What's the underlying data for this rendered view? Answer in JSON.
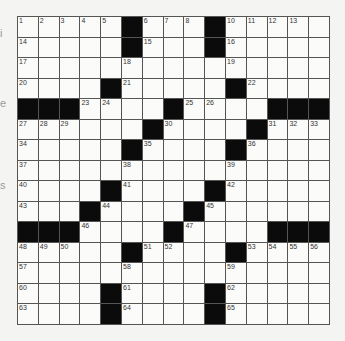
{
  "puzzle": {
    "rows": 15,
    "cols": 15,
    "blocks": [
      [
        5,
        9
      ],
      [
        5,
        9
      ],
      [],
      [
        4,
        10
      ],
      [
        0,
        1,
        2,
        7,
        12,
        13,
        14
      ],
      [
        6,
        11
      ],
      [
        5,
        10
      ],
      [],
      [
        4,
        9
      ],
      [
        3,
        8
      ],
      [
        0,
        1,
        2,
        7,
        12,
        13,
        14
      ],
      [
        5,
        10
      ],
      [],
      [
        4,
        9
      ],
      [
        4,
        9
      ]
    ],
    "numbers": [
      [
        0,
        0,
        "1"
      ],
      [
        0,
        1,
        "2"
      ],
      [
        0,
        2,
        "3"
      ],
      [
        0,
        3,
        "4"
      ],
      [
        0,
        4,
        "5"
      ],
      [
        0,
        6,
        "6"
      ],
      [
        0,
        7,
        "7"
      ],
      [
        0,
        8,
        "8"
      ],
      [
        0,
        10,
        "10"
      ],
      [
        0,
        11,
        "11"
      ],
      [
        0,
        12,
        "12"
      ],
      [
        0,
        13,
        "13"
      ],
      [
        0,
        9,
        "9"
      ],
      [
        1,
        0,
        "14"
      ],
      [
        1,
        6,
        "15"
      ],
      [
        1,
        10,
        "16"
      ],
      [
        2,
        0,
        "17"
      ],
      [
        2,
        5,
        "18"
      ],
      [
        2,
        10,
        "19"
      ],
      [
        3,
        0,
        "20"
      ],
      [
        3,
        5,
        "21"
      ],
      [
        3,
        11,
        "22"
      ],
      [
        4,
        3,
        "23"
      ],
      [
        4,
        4,
        "24"
      ],
      [
        4,
        8,
        "25"
      ],
      [
        4,
        9,
        "26"
      ],
      [
        5,
        0,
        "27"
      ],
      [
        5,
        1,
        "28"
      ],
      [
        5,
        2,
        "29"
      ],
      [
        5,
        7,
        "30"
      ],
      [
        5,
        12,
        "31"
      ],
      [
        5,
        13,
        "32"
      ],
      [
        5,
        14,
        "33"
      ],
      [
        6,
        0,
        "34"
      ],
      [
        6,
        6,
        "35"
      ],
      [
        6,
        11,
        "36"
      ],
      [
        7,
        0,
        "37"
      ],
      [
        7,
        5,
        "38"
      ],
      [
        7,
        10,
        "39"
      ],
      [
        8,
        0,
        "40"
      ],
      [
        8,
        5,
        "41"
      ],
      [
        8,
        10,
        "42"
      ],
      [
        9,
        0,
        "43"
      ],
      [
        9,
        4,
        "44"
      ],
      [
        9,
        9,
        "45"
      ],
      [
        10,
        3,
        "46"
      ],
      [
        10,
        8,
        "47"
      ],
      [
        11,
        0,
        "48"
      ],
      [
        11,
        1,
        "49"
      ],
      [
        11,
        2,
        "50"
      ],
      [
        11,
        6,
        "51"
      ],
      [
        11,
        7,
        "52"
      ],
      [
        11,
        11,
        "53"
      ],
      [
        11,
        12,
        "54"
      ],
      [
        11,
        13,
        "55"
      ],
      [
        11,
        14,
        "56"
      ],
      [
        12,
        0,
        "57"
      ],
      [
        12,
        5,
        "58"
      ],
      [
        12,
        10,
        "59"
      ],
      [
        13,
        0,
        "60"
      ],
      [
        13,
        5,
        "61"
      ],
      [
        13,
        10,
        "62"
      ],
      [
        14,
        0,
        "63"
      ],
      [
        14,
        5,
        "64"
      ],
      [
        14,
        10,
        "65"
      ]
    ]
  },
  "margin_fragments": [
    {
      "text": "i",
      "top": 28
    },
    {
      "text": "e",
      "top": 98
    },
    {
      "text": "s",
      "top": 180
    }
  ]
}
